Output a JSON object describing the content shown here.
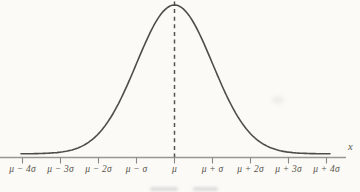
{
  "figure": {
    "x_axis_title": "x",
    "x_tick_labels": [
      "μ − 4σ",
      "μ − 3σ",
      "μ − 2σ",
      "μ − σ",
      "μ",
      "μ + σ",
      "μ + 2σ",
      "μ + 3σ",
      "μ + 4σ"
    ]
  },
  "chart_data": {
    "type": "line",
    "xlabel": "x",
    "ylabel": "",
    "x_tick_labels": [
      "μ − 4σ",
      "μ − 3σ",
      "μ − 2σ",
      "μ − σ",
      "μ",
      "μ + σ",
      "μ + 2σ",
      "μ + 3σ",
      "μ + 4σ"
    ],
    "x": [
      -4,
      -3,
      -2,
      -1,
      0,
      1,
      2,
      3,
      4
    ],
    "series": [
      {
        "name": "normal probability density (relative)",
        "function": "exp(-(x-μ)²/(2σ²))",
        "values": [
          0.0003,
          0.0111,
          0.1353,
          0.6065,
          1.0,
          0.6065,
          0.1353,
          0.0111,
          0.0003
        ]
      }
    ],
    "annotations": [
      {
        "type": "dashed-vertical-line",
        "x": 0,
        "label": "mean μ",
        "from": "peak",
        "to": "x-axis"
      }
    ],
    "xlim": [
      -4.2,
      4.5
    ],
    "ylim": [
      0,
      1.05
    ],
    "grid": false,
    "legend": "none"
  },
  "colors": {
    "background": "#fbfaf7",
    "curve": "#4f4d4a",
    "axis": "#999792",
    "tick": "#8a8883",
    "dashed_line": "#55534e",
    "text": "#575349"
  }
}
